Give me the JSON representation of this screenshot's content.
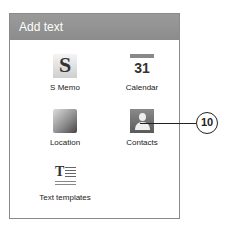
{
  "dialog": {
    "title": "Add text",
    "items": [
      {
        "label": "S Memo",
        "icon": "s-memo-icon",
        "glyph": "S"
      },
      {
        "label": "Calendar",
        "icon": "calendar-icon",
        "glyph": "31"
      },
      {
        "label": "Location",
        "icon": "location-map-icon"
      },
      {
        "label": "Contacts",
        "icon": "contacts-icon"
      },
      {
        "label": "Text templates",
        "icon": "text-templates-icon",
        "glyph": "T"
      }
    ]
  },
  "callout": {
    "number": "10"
  }
}
